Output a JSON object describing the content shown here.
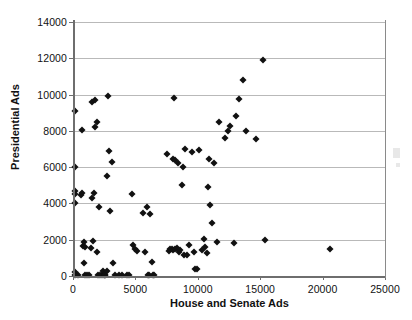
{
  "chart_data": {
    "type": "scatter",
    "title": "",
    "xlabel": "House and Senate Ads",
    "ylabel": "Presidential Ads",
    "xlim": [
      0,
      25000
    ],
    "ylim": [
      0,
      14000
    ],
    "xticks": [
      0,
      5000,
      10000,
      15000,
      20000,
      25000
    ],
    "yticks": [
      0,
      2000,
      4000,
      6000,
      8000,
      10000,
      12000,
      14000
    ],
    "xtick_labels": [
      "0",
      "5000",
      "10000",
      "15000",
      "20000",
      "25000"
    ],
    "ytick_labels": [
      "0",
      "2000",
      "4000",
      "6000",
      "8000",
      "10000",
      "12000",
      "14000"
    ],
    "grid": "horizontal",
    "grid_color": "#b9b9b9",
    "legend": null,
    "marker": "diamond",
    "marker_color": "#111111",
    "series": [
      {
        "name": "Races",
        "points": [
          [
            180,
            9100
          ],
          [
            180,
            6000
          ],
          [
            180,
            4000
          ],
          [
            180,
            4700
          ],
          [
            150,
            4500
          ],
          [
            150,
            200
          ],
          [
            200,
            50
          ],
          [
            400,
            50
          ],
          [
            620,
            4450
          ],
          [
            700,
            4550
          ],
          [
            760,
            8050
          ],
          [
            800,
            1650
          ],
          [
            850,
            1850
          ],
          [
            900,
            700
          ],
          [
            950,
            1600
          ],
          [
            980,
            50
          ],
          [
            1100,
            50
          ],
          [
            1300,
            50
          ],
          [
            1450,
            1550
          ],
          [
            1500,
            4300
          ],
          [
            1550,
            9600
          ],
          [
            1600,
            1950
          ],
          [
            1700,
            4600
          ],
          [
            1750,
            9700
          ],
          [
            1800,
            8200
          ],
          [
            1900,
            8500
          ],
          [
            1950,
            1300
          ],
          [
            2000,
            50
          ],
          [
            2100,
            3800
          ],
          [
            2200,
            50
          ],
          [
            2300,
            50
          ],
          [
            2400,
            300
          ],
          [
            2500,
            60
          ],
          [
            2550,
            60
          ],
          [
            2600,
            50
          ],
          [
            2700,
            5500
          ],
          [
            2750,
            250
          ],
          [
            2800,
            9900
          ],
          [
            2900,
            6900
          ],
          [
            3000,
            3600
          ],
          [
            3100,
            6300
          ],
          [
            3200,
            700
          ],
          [
            3400,
            50
          ],
          [
            3700,
            50
          ],
          [
            3900,
            50
          ],
          [
            4300,
            50
          ],
          [
            4500,
            50
          ],
          [
            4700,
            4500
          ],
          [
            4800,
            1700
          ],
          [
            5000,
            1500
          ],
          [
            5100,
            1400
          ],
          [
            5600,
            3500
          ],
          [
            5800,
            1350
          ],
          [
            5900,
            3800
          ],
          [
            6000,
            50
          ],
          [
            6100,
            50
          ],
          [
            6200,
            3400
          ],
          [
            6300,
            750
          ],
          [
            6400,
            50
          ],
          [
            6500,
            50
          ],
          [
            7500,
            6750
          ],
          [
            7700,
            1400
          ],
          [
            7800,
            1500
          ],
          [
            7900,
            1480
          ],
          [
            8000,
            1450
          ],
          [
            8050,
            6450
          ],
          [
            8100,
            9800
          ],
          [
            8150,
            6400
          ],
          [
            8200,
            1500
          ],
          [
            8300,
            1560
          ],
          [
            8400,
            6250
          ],
          [
            8500,
            1350
          ],
          [
            8600,
            1450
          ],
          [
            8700,
            5000
          ],
          [
            8800,
            6000
          ],
          [
            8900,
            1150
          ],
          [
            9000,
            7000
          ],
          [
            9100,
            1150
          ],
          [
            9300,
            1700
          ],
          [
            9500,
            6850
          ],
          [
            9700,
            1300
          ],
          [
            9800,
            400
          ],
          [
            9900,
            400
          ],
          [
            10100,
            6950
          ],
          [
            10300,
            1450
          ],
          [
            10500,
            2050
          ],
          [
            10600,
            1600
          ],
          [
            10700,
            1250
          ],
          [
            10800,
            4900
          ],
          [
            10900,
            6450
          ],
          [
            11000,
            3900
          ],
          [
            11100,
            2900
          ],
          [
            11300,
            6250
          ],
          [
            11500,
            1900
          ],
          [
            11700,
            8500
          ],
          [
            12200,
            7600
          ],
          [
            12400,
            8000
          ],
          [
            12600,
            8250
          ],
          [
            12900,
            1800
          ],
          [
            13100,
            8800
          ],
          [
            13300,
            9750
          ],
          [
            13600,
            10800
          ],
          [
            13900,
            8000
          ],
          [
            14700,
            7550
          ],
          [
            15200,
            11900
          ],
          [
            15400,
            2000
          ],
          [
            20600,
            1500
          ]
        ]
      }
    ]
  },
  "axes": {
    "x_title": "House and Senate Ads",
    "y_title": "Presidential Ads"
  }
}
